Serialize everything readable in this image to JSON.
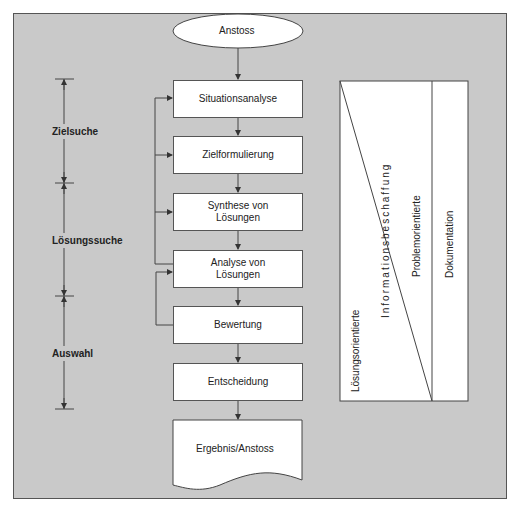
{
  "diagram": {
    "start": {
      "label": "Anstoss"
    },
    "steps": [
      {
        "label": "Situationsanalyse"
      },
      {
        "label": "Zielformulierung"
      },
      {
        "label": "Synthese von Lösungen"
      },
      {
        "label": "Analyse von Lösungen"
      },
      {
        "label": "Bewertung"
      },
      {
        "label": "Entscheidung"
      }
    ],
    "end": {
      "label": "Ergebnis/Anstoss"
    },
    "phases": [
      {
        "label": "Zielsuche"
      },
      {
        "label": "Lösungssuche"
      },
      {
        "label": "Auswahl"
      }
    ],
    "orientation_panel": {
      "left_lower": "Lösungsorientierte",
      "center": "Informationsbeschaffung",
      "right_upper": "Problemorientierte",
      "column": "Dokumentation"
    },
    "colors": {
      "background": "#c9c9c9",
      "box_fill": "#ffffff",
      "line": "#444444"
    }
  }
}
